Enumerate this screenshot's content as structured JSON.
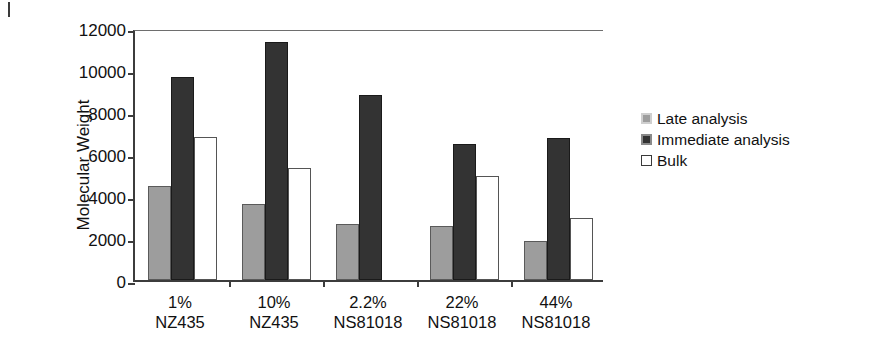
{
  "figure": {
    "corner_mark": "rule-mark"
  },
  "chart_data": {
    "type": "bar",
    "title": "",
    "xlabel": "",
    "ylabel": "Molecular Weight",
    "ylim": [
      0,
      12000
    ],
    "ytick_labels": [
      "0",
      "2000",
      "4000",
      "6000",
      "8000",
      "10000",
      "12000"
    ],
    "ytick_values": [
      0,
      2000,
      4000,
      6000,
      8000,
      10000,
      12000
    ],
    "grid": false,
    "legend_position": "right",
    "categories": [
      "1% NZ435",
      "10% NZ435",
      "2.2% NS81018",
      "22% NS81018",
      "44% NS81018"
    ],
    "category_lines": [
      [
        "1%",
        "NZ435"
      ],
      [
        "10%",
        "NZ435"
      ],
      [
        "2.2%",
        "NS81018"
      ],
      [
        "22%",
        "NS81018"
      ],
      [
        "44%",
        "NS81018"
      ]
    ],
    "series": [
      {
        "name": "Late analysis",
        "color": "#9d9d9d",
        "values": [
          4500,
          3600,
          2650,
          2550,
          1850
        ]
      },
      {
        "name": "Immediate analysis",
        "color": "#333333",
        "values": [
          9650,
          11350,
          8800,
          6500,
          6750
        ]
      },
      {
        "name": "Bulk",
        "color": "#ffffff",
        "values": [
          6800,
          5350,
          null,
          4950,
          2950
        ]
      }
    ]
  },
  "legend": {
    "items": [
      {
        "label": "Late analysis",
        "swatch": "gray-filled-square"
      },
      {
        "label": "Immediate analysis",
        "swatch": "dark-filled-square"
      },
      {
        "label": "Bulk",
        "swatch": "white-open-square"
      }
    ]
  }
}
